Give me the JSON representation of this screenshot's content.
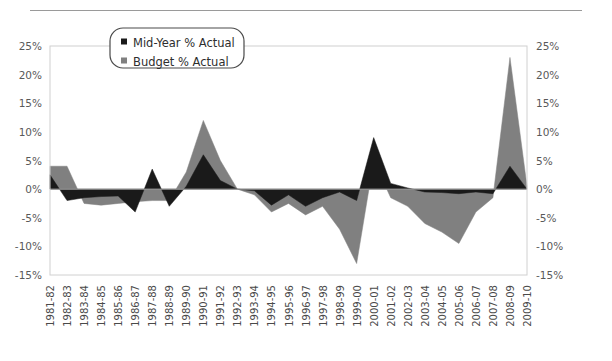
{
  "chart_data": {
    "type": "area",
    "title": "",
    "xlabel": "",
    "ylabel": "",
    "ylim": [
      -15,
      25
    ],
    "ytick_step": 5,
    "grid": false,
    "legend_position": "top-center",
    "yticks": [
      "25%",
      "20%",
      "15%",
      "10%",
      "5%",
      "0%",
      "-5%",
      "-10%",
      "-15%"
    ],
    "ytick_values": [
      25,
      20,
      15,
      10,
      5,
      0,
      -5,
      -10,
      -15
    ],
    "categories": [
      "1981-82",
      "1982-83",
      "1983-84",
      "1984-85",
      "1985-86",
      "1986-87",
      "1987-88",
      "1988-89",
      "1989-90",
      "1990-91",
      "1991-92",
      "1992-93",
      "1993-94",
      "1994-95",
      "1995-96",
      "1996-97",
      "1997-98",
      "1998-99",
      "1999-00",
      "2000-01",
      "2001-02",
      "2002-03",
      "2003-04",
      "2004-05",
      "2005-06",
      "2006-07",
      "2007-08",
      "2008-09",
      "2009-10"
    ],
    "series": [
      {
        "name": "Mid-Year % Actual",
        "color": "#1a1a1a",
        "values": [
          2.5,
          -2.0,
          -1.5,
          -1.3,
          -1.2,
          -4.0,
          3.5,
          -3.0,
          0.5,
          6.0,
          1.5,
          0.0,
          -0.3,
          -2.8,
          -1.0,
          -3.0,
          -1.5,
          -0.5,
          -2.0,
          9.0,
          1.0,
          0.2,
          -0.5,
          -0.6,
          -0.8,
          -0.5,
          -0.8,
          4.0,
          0.0
        ]
      },
      {
        "name": "Budget % Actual",
        "color": "#808080",
        "values": [
          4.0,
          4.0,
          -2.5,
          -2.8,
          -2.5,
          -2.2,
          -2.0,
          -2.0,
          3.0,
          12.0,
          5.0,
          0.0,
          -1.0,
          -4.0,
          -2.5,
          -4.5,
          -3.0,
          -7.0,
          -13.0,
          5.0,
          -1.5,
          -3.0,
          -6.0,
          -7.5,
          -9.5,
          -4.0,
          -1.5,
          23.0,
          0.5
        ]
      }
    ]
  },
  "legend": {
    "items": [
      {
        "label": "Mid-Year % Actual",
        "marker_color": "#1a1a1a"
      },
      {
        "label": "Budget % Actual",
        "marker_color": "#808080"
      }
    ]
  }
}
